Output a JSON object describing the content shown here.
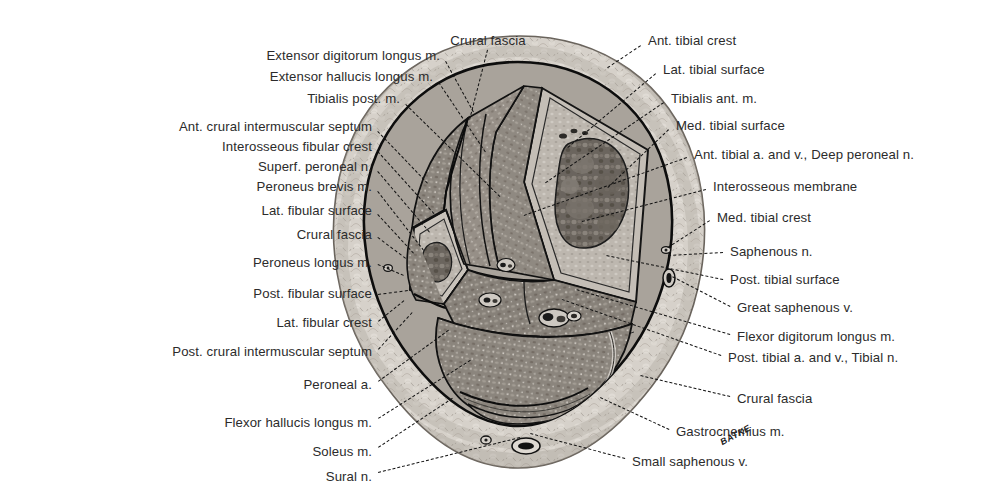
{
  "figure": {
    "type": "anatomical-cross-section",
    "region": "right leg, transverse section through middle of crus (lower leg)",
    "signature": "BATKE"
  },
  "labels_left": [
    {
      "text": "Extensor digitorum longus m.",
      "x": 440,
      "y": 56,
      "lx": 446,
      "ly": 61,
      "tx": 474,
      "ty": 112
    },
    {
      "text": "Extensor hallucis longus m.",
      "x": 433,
      "y": 77,
      "lx": 439,
      "ly": 82,
      "tx": 486,
      "ty": 152
    },
    {
      "text": "Tibialis post. m.",
      "x": 400,
      "y": 99,
      "lx": 406,
      "ly": 104,
      "tx": 500,
      "ty": 196
    },
    {
      "text": "Ant. crural intermuscular septum",
      "x": 372,
      "y": 127,
      "lx": 378,
      "ly": 131,
      "tx": 428,
      "ty": 183
    },
    {
      "text": "Interosseous fibular crest",
      "x": 372,
      "y": 147,
      "lx": 378,
      "ly": 151,
      "tx": 434,
      "ty": 213
    },
    {
      "text": "Superf. peroneal n.",
      "x": 372,
      "y": 167,
      "lx": 378,
      "ly": 171,
      "tx": 430,
      "ty": 232
    },
    {
      "text": "Peroneus brevis m.",
      "x": 372,
      "y": 187,
      "lx": 378,
      "ly": 191,
      "tx": 424,
      "ty": 250
    },
    {
      "text": "Lat. fibular surface",
      "x": 372,
      "y": 211,
      "lx": 378,
      "ly": 214,
      "tx": 414,
      "ty": 253
    },
    {
      "text": "Crural fascia",
      "x": 372,
      "y": 235,
      "lx": 378,
      "ly": 237,
      "tx": 406,
      "ty": 258
    },
    {
      "text": "Peroneus longus m.",
      "x": 372,
      "y": 263,
      "lx": 378,
      "ly": 264,
      "tx": 404,
      "ty": 275
    },
    {
      "text": "Post. fibular surface",
      "x": 372,
      "y": 294,
      "lx": 378,
      "ly": 294,
      "tx": 408,
      "ty": 290
    },
    {
      "text": "Lat. fibular crest",
      "x": 372,
      "y": 323,
      "lx": 378,
      "ly": 321,
      "tx": 404,
      "ty": 300
    },
    {
      "text": "Post. crural intermuscular septum",
      "x": 372,
      "y": 352,
      "lx": 378,
      "ly": 349,
      "tx": 412,
      "ty": 312
    },
    {
      "text": "Peroneal a.",
      "x": 372,
      "y": 385,
      "lx": 378,
      "ly": 381,
      "tx": 448,
      "ty": 330
    },
    {
      "text": "Flexor hallucis longus m.",
      "x": 372,
      "y": 423,
      "lx": 378,
      "ly": 418,
      "tx": 470,
      "ty": 360
    },
    {
      "text": "Soleus m.",
      "x": 372,
      "y": 452,
      "lx": 378,
      "ly": 447,
      "tx": 452,
      "ty": 398
    },
    {
      "text": "Sural n.",
      "x": 372,
      "y": 477,
      "lx": 378,
      "ly": 472,
      "tx": 520,
      "ty": 437
    }
  ],
  "labels_top": [
    {
      "text": "Crural fascia",
      "x": 488,
      "y": 41,
      "lx": 488,
      "ly": 50,
      "tx": 470,
      "ty": 120
    }
  ],
  "labels_right": [
    {
      "text": "Ant. tibial crest",
      "x": 648,
      "y": 41,
      "lx": 641,
      "ly": 46,
      "tx": 608,
      "ty": 68
    },
    {
      "text": "Lat. tibial surface",
      "x": 663,
      "y": 70,
      "lx": 656,
      "ly": 74,
      "tx": 568,
      "ty": 148
    },
    {
      "text": "Tibialis ant. m.",
      "x": 671,
      "y": 99,
      "lx": 664,
      "ly": 103,
      "tx": 546,
      "ty": 183
    },
    {
      "text": "Med. tibial surface",
      "x": 676,
      "y": 126,
      "lx": 669,
      "ly": 130,
      "tx": 608,
      "ty": 188
    },
    {
      "text": "Ant. tibial a. and v., Deep peroneal n.",
      "x": 694,
      "y": 155,
      "lx": 687,
      "ly": 158,
      "tx": 524,
      "ty": 216
    },
    {
      "text": "Interosseous membrane",
      "x": 713,
      "y": 187,
      "lx": 706,
      "ly": 190,
      "tx": 582,
      "ty": 222
    },
    {
      "text": "Med. tibial crest",
      "x": 717,
      "y": 218,
      "lx": 710,
      "ly": 221,
      "tx": 668,
      "ty": 248
    },
    {
      "text": "Saphenous n.",
      "x": 730,
      "y": 252,
      "lx": 723,
      "ly": 253,
      "tx": 668,
      "ty": 256
    },
    {
      "text": "Post. tibial surface",
      "x": 730,
      "y": 280,
      "lx": 723,
      "ly": 280,
      "tx": 606,
      "ty": 256
    },
    {
      "text": "Great saphenous v.",
      "x": 737,
      "y": 308,
      "lx": 730,
      "ly": 307,
      "tx": 672,
      "ty": 277
    },
    {
      "text": "Flexor digitorum longus m.",
      "x": 737,
      "y": 337,
      "lx": 730,
      "ly": 335,
      "tx": 576,
      "ty": 290
    },
    {
      "text": "Post. tibial a. and v., Tibial n.",
      "x": 728,
      "y": 358,
      "lx": 721,
      "ly": 356,
      "tx": 562,
      "ty": 300
    },
    {
      "text": "Crural fascia",
      "x": 737,
      "y": 399,
      "lx": 730,
      "ly": 397,
      "tx": 640,
      "ty": 376
    },
    {
      "text": "Gastrocnemius m.",
      "x": 676,
      "y": 432,
      "lx": 669,
      "ly": 430,
      "tx": 600,
      "ty": 398
    },
    {
      "text": "Small saphenous v.",
      "x": 632,
      "y": 462,
      "lx": 625,
      "ly": 459,
      "tx": 530,
      "ty": 434
    }
  ],
  "colors": {
    "skin": "#cfcac3",
    "subcutaneous": "#d9d4cd",
    "fascia_line": "#101010",
    "muscle_anterior": "#8d8880",
    "muscle_lateral": "#9a948b",
    "muscle_posterior_deep": "#918b83",
    "muscle_posterior_superficial": "#8a847c",
    "bone_cortex": "#b9b3ab",
    "bone_marrow": "#6f6962",
    "text": "#2b2b2b"
  }
}
